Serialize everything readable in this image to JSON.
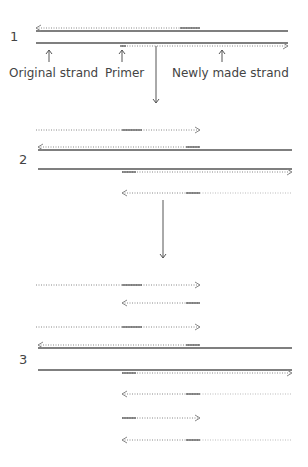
{
  "figure": {
    "colors": {
      "solid": "#555555",
      "dotted": "#888888",
      "faint": "#bbbbbb",
      "text": "#444444"
    }
  },
  "labels": {
    "original_strand": "Original strand",
    "primer": "Primer",
    "newly_made_strand": "Newly made strand"
  },
  "steps": [
    {
      "number": "1",
      "y": 46
    },
    {
      "number": "2",
      "y": 164
    },
    {
      "number": "3",
      "y": 365
    }
  ],
  "rows": [
    {
      "step": 1,
      "kind": "original",
      "dir": "left",
      "y": 31,
      "x1": 36,
      "x2": 288,
      "new_from": 36,
      "new_to": 200,
      "primer": [
        180,
        200
      ]
    },
    {
      "step": 1,
      "kind": "original",
      "dir": "right",
      "y": 43,
      "x1": 36,
      "x2": 288,
      "new_from": 122,
      "new_to": 288,
      "primer": [
        120,
        126
      ]
    },
    {
      "step": 2,
      "kind": "new",
      "dir": "right",
      "y": 130,
      "x1": 36,
      "x2": 200,
      "primer": [
        122,
        142
      ]
    },
    {
      "step": 2,
      "kind": "original",
      "dir": "left",
      "y": 150,
      "x1": 38,
      "x2": 292,
      "new_from": 38,
      "new_to": 200,
      "primer": [
        186,
        200
      ]
    },
    {
      "step": 2,
      "kind": "original",
      "dir": "right",
      "y": 169,
      "x1": 38,
      "x2": 292,
      "new_from": 122,
      "new_to": 292,
      "primer": [
        122,
        136
      ]
    },
    {
      "step": 2,
      "kind": "new",
      "dir": "left",
      "y": 193,
      "x1": 122,
      "x2": 200,
      "faint_to": 292,
      "primer": [
        186,
        200
      ]
    },
    {
      "step": 3,
      "kind": "new",
      "dir": "right",
      "y": 285,
      "x1": 36,
      "x2": 200,
      "primer": [
        122,
        142
      ]
    },
    {
      "step": 3,
      "kind": "new",
      "dir": "left",
      "y": 303,
      "x1": 122,
      "x2": 200,
      "primer": [
        186,
        200
      ]
    },
    {
      "step": 3,
      "kind": "new",
      "dir": "right",
      "y": 327,
      "x1": 36,
      "x2": 200,
      "primer": [
        122,
        142
      ]
    },
    {
      "step": 3,
      "kind": "original",
      "dir": "left",
      "y": 348,
      "x1": 38,
      "x2": 292,
      "new_from": 38,
      "new_to": 200,
      "primer": [
        186,
        200
      ]
    },
    {
      "step": 3,
      "kind": "original",
      "dir": "right",
      "y": 370,
      "x1": 38,
      "x2": 292,
      "new_from": 122,
      "new_to": 292,
      "primer": [
        122,
        136
      ]
    },
    {
      "step": 3,
      "kind": "new",
      "dir": "left",
      "y": 394,
      "x1": 122,
      "x2": 200,
      "faint_to": 292,
      "primer": [
        186,
        200
      ]
    },
    {
      "step": 3,
      "kind": "new",
      "dir": "right",
      "y": 418,
      "x1": 122,
      "x2": 200,
      "primer": [
        122,
        136
      ]
    },
    {
      "step": 3,
      "kind": "new",
      "dir": "left",
      "y": 440,
      "x1": 122,
      "x2": 200,
      "faint_to": 292,
      "primer": [
        186,
        200
      ]
    }
  ],
  "pointer_arrows": [
    {
      "label": "original_strand",
      "x": 49,
      "y1": 62,
      "y2": 50
    },
    {
      "label": "primer",
      "x": 122,
      "y1": 62,
      "y2": 50
    },
    {
      "label": "newly_made_strand",
      "x": 222,
      "y1": 62,
      "y2": 50
    }
  ],
  "flow_arrows": [
    {
      "x": 156,
      "y1": 46,
      "y2": 103
    },
    {
      "x": 163,
      "y1": 200,
      "y2": 258
    }
  ]
}
